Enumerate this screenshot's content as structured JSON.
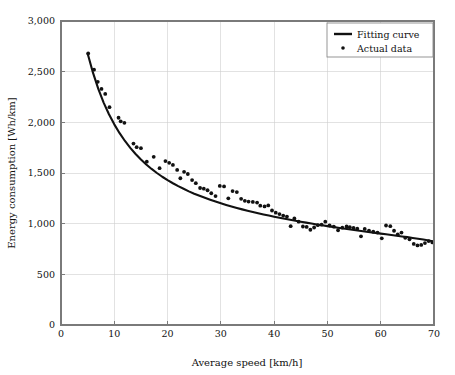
{
  "chart_data": {
    "type": "scatter",
    "title": "",
    "xlabel": "Average speed [km/h]",
    "ylabel": "Energy consumption [Wh/km]",
    "xlim": [
      0,
      70
    ],
    "ylim": [
      0,
      3000
    ],
    "xticks": [
      0,
      10,
      20,
      30,
      40,
      50,
      60,
      70
    ],
    "yticks": [
      0,
      500,
      1000,
      1500,
      2000,
      2500,
      3000
    ],
    "xtick_labels": [
      "0",
      "10",
      "20",
      "30",
      "40",
      "50",
      "60",
      "70"
    ],
    "ytick_labels": [
      "0",
      "500",
      "1,000",
      "1,500",
      "2,000",
      "2,500",
      "3,000"
    ],
    "grid": true,
    "legend_position": "top-right",
    "series": [
      {
        "name": "Fitting curve",
        "type": "line",
        "color": "#111111",
        "points": [
          [
            5.0,
            2680
          ],
          [
            6.0,
            2490
          ],
          [
            7.0,
            2330
          ],
          [
            8.0,
            2195
          ],
          [
            9.0,
            2080
          ],
          [
            10.0,
            1980
          ],
          [
            11.0,
            1893
          ],
          [
            12.0,
            1816
          ],
          [
            13.0,
            1748
          ],
          [
            14.0,
            1687
          ],
          [
            15.0,
            1633
          ],
          [
            16.0,
            1584
          ],
          [
            17.0,
            1540
          ],
          [
            18.0,
            1500
          ],
          [
            19.0,
            1463
          ],
          [
            20.0,
            1430
          ],
          [
            21.0,
            1399
          ],
          [
            22.0,
            1370
          ],
          [
            23.0,
            1344
          ],
          [
            24.0,
            1319
          ],
          [
            25.0,
            1296
          ],
          [
            26.0,
            1275
          ],
          [
            27.0,
            1255
          ],
          [
            28.0,
            1236
          ],
          [
            29.0,
            1218
          ],
          [
            30.0,
            1201
          ],
          [
            31.0,
            1185
          ],
          [
            32.0,
            1170
          ],
          [
            33.0,
            1155
          ],
          [
            34.0,
            1141
          ],
          [
            35.0,
            1128
          ],
          [
            36.0,
            1115
          ],
          [
            37.0,
            1103
          ],
          [
            38.0,
            1091
          ],
          [
            39.0,
            1080
          ],
          [
            40.0,
            1069
          ],
          [
            41.0,
            1058
          ],
          [
            42.0,
            1048
          ],
          [
            43.0,
            1038
          ],
          [
            44.0,
            1028
          ],
          [
            45.0,
            1019
          ],
          [
            46.0,
            1010
          ],
          [
            47.0,
            1001
          ],
          [
            48.0,
            992
          ],
          [
            49.0,
            984
          ],
          [
            50.0,
            976
          ],
          [
            51.0,
            968
          ],
          [
            52.0,
            960
          ],
          [
            53.0,
            952
          ],
          [
            54.0,
            945
          ],
          [
            55.0,
            937
          ],
          [
            56.0,
            930
          ],
          [
            57.0,
            923
          ],
          [
            58.0,
            916
          ],
          [
            59.0,
            909
          ],
          [
            60.0,
            902
          ],
          [
            61.0,
            895
          ],
          [
            62.0,
            888
          ],
          [
            63.0,
            881
          ],
          [
            64.0,
            874
          ],
          [
            65.0,
            867
          ],
          [
            66.0,
            859
          ],
          [
            67.0,
            851
          ],
          [
            68.0,
            843
          ],
          [
            69.0,
            834
          ],
          [
            70.0,
            824
          ]
        ]
      },
      {
        "name": "Actual data",
        "type": "scatter",
        "color": "#111111",
        "marker": "dot",
        "points": [
          [
            5.1,
            2680
          ],
          [
            6.2,
            2520
          ],
          [
            6.9,
            2400
          ],
          [
            7.6,
            2330
          ],
          [
            8.3,
            2280
          ],
          [
            9.1,
            2150
          ],
          [
            10.8,
            2045
          ],
          [
            11.2,
            2010
          ],
          [
            11.9,
            1995
          ],
          [
            13.6,
            1790
          ],
          [
            14.2,
            1755
          ],
          [
            15.0,
            1745
          ],
          [
            16.1,
            1612
          ],
          [
            17.4,
            1660
          ],
          [
            18.5,
            1548
          ],
          [
            19.6,
            1618
          ],
          [
            20.3,
            1600
          ],
          [
            21.0,
            1580
          ],
          [
            21.8,
            1530
          ],
          [
            22.4,
            1448
          ],
          [
            23.1,
            1512
          ],
          [
            23.8,
            1490
          ],
          [
            24.6,
            1430
          ],
          [
            25.3,
            1400
          ],
          [
            26.1,
            1352
          ],
          [
            26.8,
            1345
          ],
          [
            27.5,
            1330
          ],
          [
            28.2,
            1300
          ],
          [
            29.0,
            1272
          ],
          [
            29.8,
            1372
          ],
          [
            30.6,
            1368
          ],
          [
            31.4,
            1250
          ],
          [
            32.2,
            1322
          ],
          [
            33.0,
            1312
          ],
          [
            33.8,
            1245
          ],
          [
            34.5,
            1225
          ],
          [
            35.2,
            1218
          ],
          [
            36.0,
            1215
          ],
          [
            36.8,
            1208
          ],
          [
            37.4,
            1178
          ],
          [
            38.2,
            1170
          ],
          [
            38.9,
            1180
          ],
          [
            39.6,
            1130
          ],
          [
            40.3,
            1108
          ],
          [
            41.0,
            1095
          ],
          [
            41.7,
            1080
          ],
          [
            42.4,
            1070
          ],
          [
            43.1,
            975
          ],
          [
            43.8,
            1052
          ],
          [
            44.6,
            1020
          ],
          [
            45.4,
            972
          ],
          [
            46.1,
            968
          ],
          [
            46.8,
            940
          ],
          [
            47.5,
            962
          ],
          [
            48.2,
            985
          ],
          [
            48.9,
            990
          ],
          [
            49.6,
            1020
          ],
          [
            50.4,
            982
          ],
          [
            51.2,
            970
          ],
          [
            52.0,
            935
          ],
          [
            52.8,
            960
          ],
          [
            53.6,
            972
          ],
          [
            54.2,
            965
          ],
          [
            54.9,
            958
          ],
          [
            55.6,
            950
          ],
          [
            56.3,
            875
          ],
          [
            57.0,
            948
          ],
          [
            57.8,
            932
          ],
          [
            58.6,
            920
          ],
          [
            59.4,
            912
          ],
          [
            60.2,
            855
          ],
          [
            61.0,
            982
          ],
          [
            61.8,
            975
          ],
          [
            62.5,
            930
          ],
          [
            63.2,
            895
          ],
          [
            63.9,
            912
          ],
          [
            64.6,
            860
          ],
          [
            65.4,
            845
          ],
          [
            66.2,
            800
          ],
          [
            66.9,
            785
          ],
          [
            67.6,
            790
          ],
          [
            68.3,
            808
          ],
          [
            69.0,
            828
          ],
          [
            69.7,
            815
          ]
        ]
      }
    ]
  },
  "legend": {
    "entries": [
      {
        "label": "Fitting curve",
        "marker": "line"
      },
      {
        "label": "Actual data",
        "marker": "dot"
      }
    ]
  },
  "colors": {
    "foreground": "#111111",
    "axis": "#7a7a7a",
    "grid": "#cfcfcf",
    "background": "#ffffff"
  }
}
